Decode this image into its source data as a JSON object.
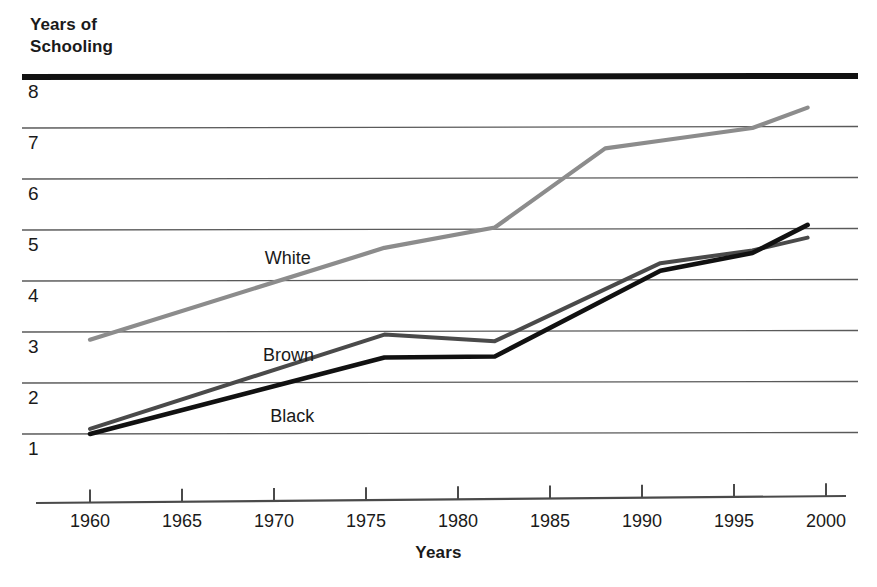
{
  "chart_data": {
    "type": "line",
    "title": "",
    "xlabel": "Years",
    "ylabel": "Years of\nSchooling",
    "xlim": [
      1958,
      2001
    ],
    "ylim": [
      0.4,
      8.0
    ],
    "grid": "horizontal",
    "legend_position": "inline-labels",
    "xticks": [
      1960,
      1965,
      1970,
      1975,
      1980,
      1985,
      1990,
      1995,
      2000
    ],
    "xtick_labels": [
      "1960",
      "1965",
      "1970",
      "1975",
      "1980",
      "1985",
      "1990",
      "1995",
      "2000"
    ],
    "yticks": [
      1,
      2,
      3,
      4,
      5,
      6,
      7,
      8
    ],
    "ytick_labels": [
      "1",
      "2",
      "3",
      "4",
      "5",
      "6",
      "7",
      "8"
    ],
    "series": [
      {
        "name": "White",
        "color": "#8c8c8c",
        "label": "White",
        "label_x": 1969.5,
        "label_y": 4.45,
        "x": [
          1960,
          1976,
          1982,
          1988,
          1991,
          1996,
          1999
        ],
        "y": [
          2.85,
          4.65,
          5.05,
          6.6,
          6.75,
          7.0,
          7.4
        ]
      },
      {
        "name": "Brown",
        "color": "#4a4a4a",
        "label": "Brown",
        "label_x": 1969.4,
        "label_y": 2.55,
        "x": [
          1960,
          1976,
          1982,
          1991,
          1996,
          1999
        ],
        "y": [
          1.1,
          2.95,
          2.82,
          4.35,
          4.6,
          4.85
        ]
      },
      {
        "name": "Black",
        "color": "#111111",
        "label": "Black",
        "label_x": 1969.8,
        "label_y": 1.35,
        "x": [
          1960,
          1976,
          1982,
          1991,
          1996,
          1999
        ],
        "y": [
          1.0,
          2.5,
          2.52,
          4.2,
          4.55,
          5.1
        ]
      }
    ]
  },
  "axes": {
    "y_title_text": "Years of\nSchooling",
    "x_title_text": "Years"
  },
  "colors": {
    "top_rule": "#111111",
    "gridline": "#5a5a5a",
    "axis_line": "#4a4a4a",
    "white_series": "#8c8c8c",
    "brown_series": "#4a4a4a",
    "black_series": "#111111"
  }
}
